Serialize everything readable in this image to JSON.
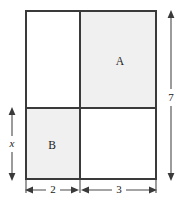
{
  "figure": {
    "colors": {
      "shaded_fill": "#f0f0f0",
      "blank_fill": "#ffffff",
      "stroke": "#3a3a3a",
      "dimension_stroke": "#4a4a4a",
      "background": "#ffffff"
    },
    "regions": [
      {
        "id": "top-left",
        "label": "",
        "shaded": false,
        "x": 26,
        "y": 11,
        "width": 54,
        "height": 97
      },
      {
        "id": "top-right",
        "label": "A",
        "shaded": true,
        "x": 80,
        "y": 11,
        "width": 76,
        "height": 97,
        "label_x": 120,
        "label_y": 62
      },
      {
        "id": "bottom-left",
        "label": "B",
        "shaded": true,
        "x": 26,
        "y": 108,
        "width": 54,
        "height": 71,
        "label_x": 52,
        "label_y": 146
      },
      {
        "id": "bottom-right",
        "label": "",
        "shaded": false,
        "x": 80,
        "y": 108,
        "width": 76,
        "height": 71
      }
    ],
    "dimensions": [
      {
        "id": "height-total",
        "label": "7",
        "orientation": "vertical",
        "position": "right",
        "label_x": 171,
        "label_y": 97,
        "line_x": 171,
        "line_y1": 11,
        "line_y2": 180
      },
      {
        "id": "height-lower",
        "label": "x",
        "italic": true,
        "orientation": "vertical",
        "position": "left",
        "label_x": 12,
        "label_y": 144,
        "line_x": 12,
        "line_y1": 108,
        "line_y2": 180
      },
      {
        "id": "width-left",
        "label": "2",
        "orientation": "horizontal",
        "position": "bottom",
        "label_x": 53,
        "label_y": 190,
        "line_y": 190,
        "line_x1": 26,
        "line_x2": 78
      },
      {
        "id": "width-right",
        "label": "3",
        "orientation": "horizontal",
        "position": "bottom",
        "label_x": 119,
        "label_y": 190,
        "line_y": 190,
        "line_x1": 82,
        "line_x2": 156
      }
    ],
    "outer_rectangle": {
      "x": 26,
      "y": 11,
      "width": 130,
      "height": 168
    },
    "dividers": {
      "vertical_x": 80,
      "horizontal_y": 108
    }
  }
}
